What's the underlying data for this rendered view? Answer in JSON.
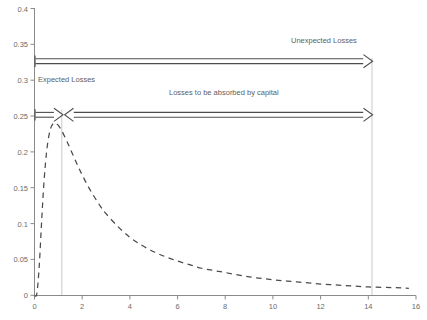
{
  "chart_data": {
    "type": "line",
    "title": "",
    "subtitle": "",
    "xlabel": "",
    "ylabel": "",
    "xlim": [
      0,
      16
    ],
    "ylim": [
      0,
      0.4
    ],
    "grid": false,
    "legend_position": "none",
    "x_ticks": [
      0,
      2,
      4,
      6,
      8,
      10,
      12,
      14,
      16
    ],
    "x_tick_labels": [
      "0",
      "2",
      "4",
      "6",
      "8",
      "10",
      "12",
      "14",
      "16"
    ],
    "y_ticks": [
      0,
      0.05,
      0.1,
      0.15,
      0.2,
      0.25,
      0.3,
      0.35,
      0.4
    ],
    "y_tick_labels": [
      "0",
      "0.05",
      "0.1",
      "0.15",
      "0.2",
      "0.25",
      "0.3",
      "0.35",
      "0.4"
    ],
    "series": [
      {
        "name": "loss-density",
        "style": "dashed",
        "color": "#4a4a4a",
        "x": [
          0.0,
          0.1,
          0.2,
          0.3,
          0.4,
          0.5,
          0.6,
          0.7,
          0.8,
          0.9,
          1.0,
          1.1,
          1.2,
          1.4,
          1.6,
          1.8,
          2.0,
          2.25,
          2.5,
          2.75,
          3.0,
          3.5,
          4.0,
          4.5,
          5.0,
          5.5,
          6.0,
          6.5,
          7.0,
          7.5,
          8.0,
          9.0,
          10.0,
          11.0,
          12.0,
          13.0,
          14.0,
          15.0,
          15.7
        ],
        "y": [
          0.0,
          0.003,
          0.042,
          0.104,
          0.159,
          0.198,
          0.222,
          0.235,
          0.24,
          0.24,
          0.237,
          0.232,
          0.226,
          0.212,
          0.197,
          0.182,
          0.168,
          0.152,
          0.138,
          0.125,
          0.114,
          0.096,
          0.081,
          0.07,
          0.061,
          0.054,
          0.048,
          0.043,
          0.038,
          0.035,
          0.032,
          0.026,
          0.022,
          0.019,
          0.016,
          0.014,
          0.012,
          0.011,
          0.01
        ]
      }
    ],
    "vertical_lines": [
      {
        "name": "expected-loss-line",
        "x": 1.15,
        "color": "#c8c8c8"
      },
      {
        "name": "unexpected-loss-line",
        "x": 14.2,
        "color": "#c8c8c8"
      }
    ],
    "annotations": [
      {
        "name": "unexpected-losses",
        "text": "Unexpected Losses",
        "x": 10.6,
        "y": 0.362
      },
      {
        "name": "expected-losses",
        "text": "Expected Losses",
        "x": 0.35,
        "y": 0.3
      },
      {
        "name": "losses-absorbed-by-capital",
        "text": "Losses to be absorbed by capital",
        "x": 5.7,
        "y": 0.287
      }
    ],
    "arrows": [
      {
        "name": "unexpected-losses-arrow",
        "x_start": 0.0,
        "x_end": 14.2,
        "y": 0.3335,
        "heads": "right",
        "color": "#4d4d4d"
      },
      {
        "name": "expected-losses-arrow",
        "x_start": 0.0,
        "x_end": 1.15,
        "y": 0.2585,
        "heads": "right",
        "color": "#4d4d4d"
      },
      {
        "name": "capital-absorbed-arrow",
        "x_start": 1.15,
        "x_end": 14.2,
        "y": 0.2585,
        "heads": "both-inward-left",
        "color": "#4d4d4d"
      }
    ],
    "axis_color": "#8a8a8a",
    "background_color": "#ffffff"
  },
  "axis": {
    "y_labels": [
      "0.4",
      "0.35",
      "0.3",
      "0.25",
      "0.2",
      "0.15",
      "0.1",
      "0.05",
      "0"
    ],
    "x_labels": [
      "0",
      "2",
      "4",
      "6",
      "8",
      "10",
      "12",
      "14",
      "16"
    ]
  },
  "labels": {
    "unexpected_losses": "Unexpected Losses",
    "expected_losses": "Expected Losses",
    "absorbed_by_capital": "Losses to be absorbed by capital"
  },
  "colors": {
    "curve": "#4a4a4a",
    "axis": "#8a8a8a",
    "gridline": "#c8c8c8",
    "text": "#5e5e5e",
    "background": "#ffffff"
  }
}
